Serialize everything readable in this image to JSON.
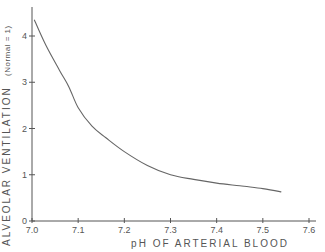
{
  "chart_data": {
    "type": "line",
    "title": "",
    "xlabel": "pH OF ARTERIAL BLOOD",
    "ylabel": "ALVEOLAR VENTILATION",
    "ylabel_sub": "(Normal = 1)",
    "xlim": [
      7.0,
      7.6
    ],
    "ylim": [
      0,
      4.6
    ],
    "x_ticks": [
      "7.0",
      "7.1",
      "7.2",
      "7.3",
      "7.4",
      "7.5",
      "7.6"
    ],
    "y_ticks": [
      "0",
      "1",
      "2",
      "3",
      "4"
    ],
    "grid": false,
    "legend": null,
    "series": [
      {
        "name": "Alveolar ventilation",
        "x": [
          7.005,
          7.03,
          7.06,
          7.08,
          7.1,
          7.13,
          7.16,
          7.2,
          7.25,
          7.3,
          7.35,
          7.4,
          7.45,
          7.5,
          7.54
        ],
        "values": [
          4.35,
          3.8,
          3.25,
          2.9,
          2.45,
          2.05,
          1.8,
          1.5,
          1.2,
          1.0,
          0.9,
          0.82,
          0.76,
          0.7,
          0.63
        ]
      }
    ]
  }
}
